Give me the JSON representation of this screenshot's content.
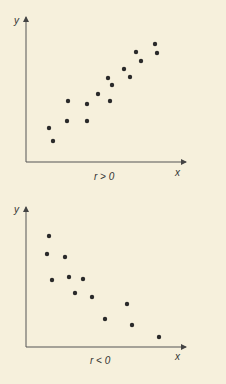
{
  "chart_data": [
    {
      "type": "scatter",
      "title": "",
      "caption": "r > 0",
      "xlabel": "x",
      "ylabel": "y",
      "grid": false,
      "points": [
        [
          49,
          128
        ],
        [
          53,
          141
        ],
        [
          68,
          101
        ],
        [
          67,
          121
        ],
        [
          87,
          104
        ],
        [
          87,
          121
        ],
        [
          98,
          94
        ],
        [
          108,
          78
        ],
        [
          112,
          85
        ],
        [
          110,
          101
        ],
        [
          124,
          69
        ],
        [
          130,
          77
        ],
        [
          136,
          52
        ],
        [
          141,
          61
        ],
        [
          155,
          44
        ],
        [
          157,
          53
        ]
      ]
    },
    {
      "type": "scatter",
      "title": "",
      "caption": "r < 0",
      "xlabel": "x",
      "ylabel": "y",
      "grid": false,
      "points": [
        [
          49,
          236
        ],
        [
          47,
          254
        ],
        [
          65,
          257
        ],
        [
          52,
          280
        ],
        [
          69,
          277
        ],
        [
          83,
          279
        ],
        [
          75,
          293
        ],
        [
          92,
          297
        ],
        [
          127,
          304
        ],
        [
          105,
          319
        ],
        [
          132,
          325
        ],
        [
          159,
          337
        ]
      ]
    }
  ],
  "colors": {
    "background": "#f6f0dc",
    "ink": "#2a2a2a"
  }
}
